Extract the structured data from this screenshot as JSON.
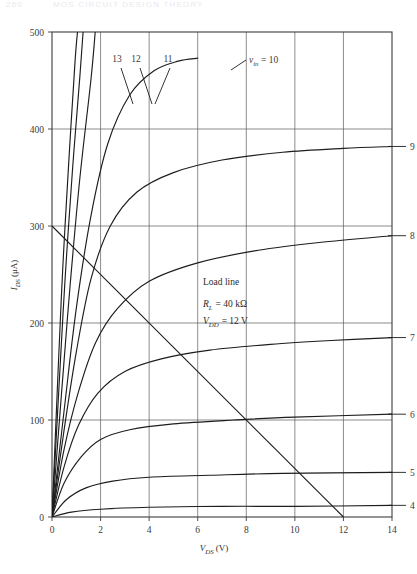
{
  "page_header": {
    "page_number": "260",
    "running_head": "MOS CIRCUIT DESIGN THEORY"
  },
  "figure": {
    "annotations": {
      "load_line_label": "Load line",
      "rl_symbol": "R",
      "rl_sub": "L",
      "rl_value": "= 40 kΩ",
      "vdd_symbol": "V",
      "vdd_sub": "DD",
      "vdd_value": "= 12 V"
    },
    "inline_curve_label": {
      "symbol": "v",
      "sub": "in",
      "value": "= 10"
    }
  },
  "chart_data": {
    "type": "line",
    "title": "",
    "xlabel": "V_DS (V)",
    "ylabel": "I_DS (μA)",
    "xlabel_parts": {
      "symbol": "V",
      "sub": "DS",
      "unit": "(V)"
    },
    "ylabel_parts": {
      "symbol": "I",
      "sub": "DS",
      "unit": "(μA)"
    },
    "xlim": [
      0,
      14
    ],
    "ylim": [
      0,
      500
    ],
    "xticks": [
      0,
      2,
      4,
      6,
      8,
      10,
      12,
      14
    ],
    "yticks": [
      0,
      100,
      200,
      300,
      400,
      500
    ],
    "xtick_labels": [
      "0",
      "2",
      "4",
      "6",
      "8",
      "10",
      "12",
      "14"
    ],
    "ytick_labels": [
      "0",
      "100",
      "200",
      "300",
      "400",
      "500"
    ],
    "grid": true,
    "grid_axis": "both",
    "legend": "inline curve end labels",
    "series_parameter": "v_in (V)",
    "series": [
      {
        "name": "13",
        "label": "13",
        "label_side": "top",
        "points": [
          [
            0,
            0
          ],
          [
            0.25,
            150
          ],
          [
            0.45,
            260
          ],
          [
            0.7,
            370
          ],
          [
            0.95,
            470
          ],
          [
            1.05,
            500
          ]
        ]
      },
      {
        "name": "12",
        "label": "12",
        "label_side": "top",
        "points": [
          [
            0,
            0
          ],
          [
            0.3,
            140
          ],
          [
            0.55,
            250
          ],
          [
            0.85,
            360
          ],
          [
            1.15,
            455
          ],
          [
            1.28,
            500
          ]
        ]
      },
      {
        "name": "11",
        "label": "11",
        "label_side": "top",
        "points": [
          [
            0,
            0
          ],
          [
            0.4,
            130
          ],
          [
            0.75,
            240
          ],
          [
            1.15,
            350
          ],
          [
            1.6,
            450
          ],
          [
            1.78,
            500
          ]
        ]
      },
      {
        "name": "10",
        "label": "v_in = 10",
        "label_side": "inline",
        "points": [
          [
            0,
            0
          ],
          [
            0.5,
            110
          ],
          [
            1.0,
            215
          ],
          [
            1.6,
            310
          ],
          [
            2.3,
            385
          ],
          [
            3.2,
            435
          ],
          [
            4.2,
            460
          ],
          [
            5.2,
            470
          ],
          [
            6.0,
            473
          ]
        ]
      },
      {
        "name": "9",
        "label": "9",
        "label_side": "right",
        "points": [
          [
            0,
            0
          ],
          [
            0.5,
            90
          ],
          [
            1.0,
            170
          ],
          [
            1.6,
            245
          ],
          [
            2.4,
            300
          ],
          [
            3.5,
            335
          ],
          [
            5.0,
            355
          ],
          [
            7.0,
            368
          ],
          [
            9.5,
            376
          ],
          [
            12.0,
            380
          ],
          [
            14.0,
            382
          ]
        ]
      },
      {
        "name": "8",
        "label": "8",
        "label_side": "right",
        "points": [
          [
            0,
            0
          ],
          [
            0.5,
            70
          ],
          [
            1.1,
            130
          ],
          [
            1.8,
            180
          ],
          [
            2.7,
            215
          ],
          [
            4.0,
            243
          ],
          [
            6.0,
            262
          ],
          [
            8.5,
            275
          ],
          [
            11.0,
            283
          ],
          [
            14.0,
            290
          ]
        ]
      },
      {
        "name": "7",
        "label": "7",
        "label_side": "right",
        "points": [
          [
            0,
            0
          ],
          [
            0.5,
            52
          ],
          [
            1.1,
            95
          ],
          [
            1.9,
            128
          ],
          [
            3.0,
            150
          ],
          [
            4.5,
            163
          ],
          [
            6.5,
            172
          ],
          [
            9.0,
            178
          ],
          [
            11.5,
            182
          ],
          [
            14.0,
            185
          ]
        ]
      },
      {
        "name": "6",
        "label": "6",
        "label_side": "right",
        "points": [
          [
            0,
            0
          ],
          [
            0.5,
            35
          ],
          [
            1.2,
            62
          ],
          [
            2.0,
            80
          ],
          [
            3.2,
            90
          ],
          [
            5.0,
            96
          ],
          [
            7.5,
            100
          ],
          [
            10.0,
            103
          ],
          [
            14.0,
            106
          ]
        ]
      },
      {
        "name": "5",
        "label": "5",
        "label_side": "right",
        "points": [
          [
            0,
            0
          ],
          [
            0.6,
            18
          ],
          [
            1.4,
            30
          ],
          [
            2.5,
            37
          ],
          [
            4.0,
            41
          ],
          [
            6.5,
            43
          ],
          [
            9.5,
            45
          ],
          [
            14.0,
            46
          ]
        ]
      },
      {
        "name": "4",
        "label": "4",
        "label_side": "right",
        "points": [
          [
            0,
            0
          ],
          [
            0.8,
            5
          ],
          [
            2.0,
            8
          ],
          [
            4.0,
            10
          ],
          [
            7.0,
            11
          ],
          [
            10.0,
            11
          ],
          [
            14.0,
            12
          ]
        ]
      }
    ],
    "load_line": {
      "name": "load line",
      "label": "Load line",
      "r_load_kohm": 40,
      "v_supply_volts": 12,
      "y_intercept_ua": 300,
      "x_intercept_volts": 12,
      "points": [
        [
          0,
          300
        ],
        [
          12,
          0
        ]
      ]
    }
  }
}
